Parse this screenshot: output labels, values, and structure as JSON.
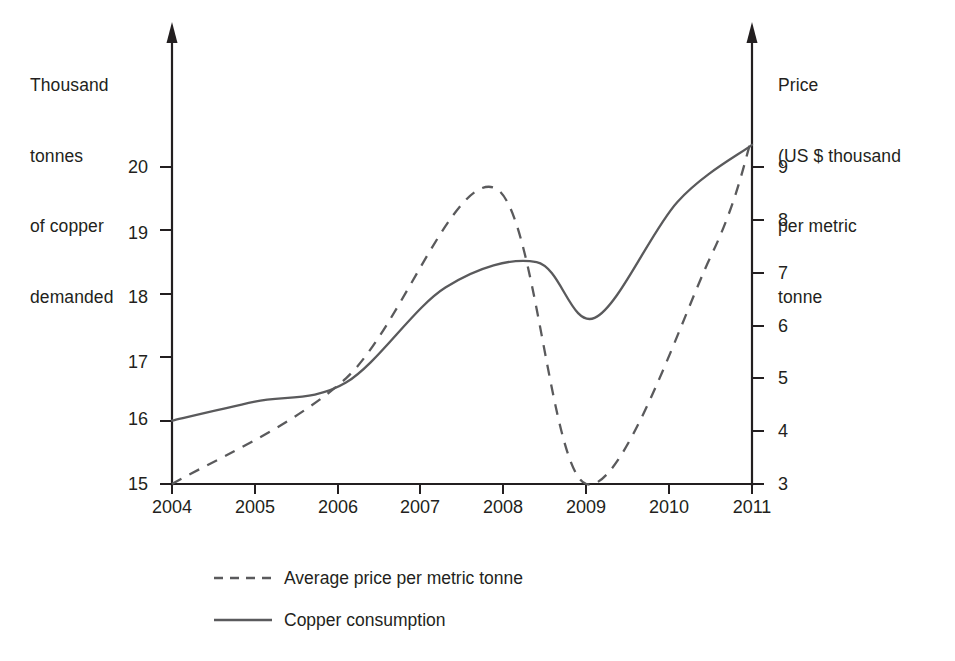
{
  "axes": {
    "left_title": "Thousand\ntonnes\nof copper\ndemanded",
    "left_title_lines": [
      "Thousand",
      "tonnes",
      "of copper",
      "demanded"
    ],
    "right_title": "Price\n(US $ thousand\nper metric\ntonne",
    "right_title_lines": [
      "Price",
      "(US $ thousand",
      "per metric",
      "tonne"
    ],
    "left_ticks": [
      "20",
      "19",
      "18",
      "17",
      "16",
      "15"
    ],
    "right_ticks": [
      "9",
      "8",
      "7",
      "6",
      "5",
      "4",
      "3"
    ],
    "x_ticks": [
      "2004",
      "2005",
      "2006",
      "2007",
      "2008",
      "2009",
      "2010",
      "2011"
    ]
  },
  "legend": {
    "items": [
      {
        "label": "Average price per metric tonne",
        "style": "dashed"
      },
      {
        "label": "Copper consumption",
        "style": "solid"
      }
    ]
  },
  "colors": {
    "line": "#5a5a5c",
    "axis": "#231f20",
    "text": "#231f20",
    "background": "#ffffff"
  },
  "chart_data": {
    "type": "line",
    "title": "",
    "xlabel": "",
    "ylabel": "Thousand tonnes of copper demanded",
    "y2label": "Price (US $ thousand per metric tonne",
    "x": [
      2004,
      2005,
      2006,
      2007,
      2008,
      2009,
      2010,
      2011
    ],
    "xlim": [
      2004,
      2011
    ],
    "ylim": [
      15,
      20
    ],
    "y2lim": [
      3,
      9
    ],
    "grid": false,
    "legend_position": "below-left",
    "series": [
      {
        "name": "Copper consumption",
        "axis": "left",
        "style": "solid",
        "units": "thousand tonnes",
        "values": [
          16.0,
          16.3,
          16.6,
          17.9,
          18.45,
          17.65,
          19.45,
          20.35
        ],
        "points": [
          {
            "x": 2004.0,
            "y": 16.0
          },
          {
            "x": 2005.0,
            "y": 16.3
          },
          {
            "x": 2006.1,
            "y": 16.6
          },
          {
            "x": 2007.3,
            "y": 18.1
          },
          {
            "x": 2008.4,
            "y": 18.5
          },
          {
            "x": 2009.1,
            "y": 17.62
          },
          {
            "x": 2010.1,
            "y": 19.45
          },
          {
            "x": 2011.0,
            "y": 20.35
          }
        ]
      },
      {
        "name": "Average price per metric tonne",
        "axis": "right",
        "style": "dashed",
        "units": "US $ thousand per metric tonne",
        "values": [
          3.0,
          4.0,
          5.0,
          7.0,
          8.5,
          3.0,
          6.4,
          9.5
        ],
        "points": [
          {
            "x": 2004.0,
            "y": 3.0
          },
          {
            "x": 2006.1,
            "y": 5.0
          },
          {
            "x": 2007.9,
            "y": 8.6
          },
          {
            "x": 2009.0,
            "y": 3.0
          },
          {
            "x": 2010.5,
            "y": 7.3
          },
          {
            "x": 2011.0,
            "y": 9.55
          }
        ]
      }
    ]
  }
}
